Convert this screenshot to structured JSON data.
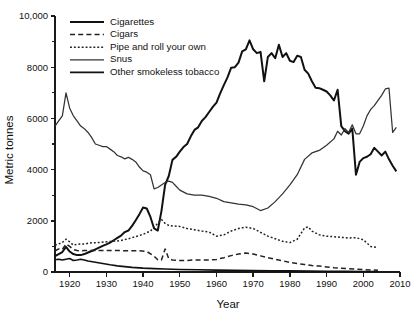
{
  "chart_data": {
    "type": "line",
    "title": "",
    "xlabel": "Year",
    "ylabel": "Metric tonnes",
    "xlim": [
      1916,
      2010
    ],
    "ylim": [
      0,
      10000
    ],
    "grid": false,
    "legend_position": "top-left",
    "xticks": [
      1920,
      1930,
      1940,
      1950,
      1960,
      1970,
      1980,
      1990,
      2000,
      2010
    ],
    "xtick_labels": [
      "1920",
      "1930",
      "1940",
      "1950",
      "1960",
      "1970",
      "1980",
      "1990",
      "2000",
      "2010"
    ],
    "yticks": [
      0,
      2000,
      4000,
      6000,
      8000,
      10000
    ],
    "ytick_labels": [
      "0",
      "2000",
      "4000",
      "6000",
      "8000",
      "10,000"
    ],
    "yticks_minor": [
      1000,
      3000,
      5000,
      7000,
      9000
    ],
    "series": [
      {
        "name": "Cigarettes",
        "style": "solid",
        "width": 2.0,
        "color": "#111111",
        "x": [
          1916,
          1917,
          1918,
          1919,
          1920,
          1921,
          1922,
          1923,
          1924,
          1925,
          1926,
          1927,
          1928,
          1929,
          1930,
          1931,
          1932,
          1933,
          1934,
          1935,
          1936,
          1937,
          1938,
          1939,
          1940,
          1941,
          1942,
          1943,
          1944,
          1945,
          1946,
          1947,
          1948,
          1949,
          1950,
          1951,
          1952,
          1953,
          1954,
          1955,
          1956,
          1957,
          1958,
          1959,
          1960,
          1961,
          1962,
          1963,
          1964,
          1965,
          1966,
          1967,
          1968,
          1969,
          1970,
          1971,
          1972,
          1973,
          1974,
          1975,
          1976,
          1977,
          1978,
          1979,
          1980,
          1981,
          1982,
          1983,
          1984,
          1985,
          1986,
          1987,
          1988,
          1989,
          1990,
          1991,
          1992,
          1993,
          1994,
          1995,
          1996,
          1997,
          1998,
          1999,
          2000,
          2001,
          2002,
          2003,
          2004,
          2005,
          2006,
          2007,
          2008,
          2009
        ],
        "y": [
          620,
          700,
          780,
          980,
          800,
          700,
          660,
          660,
          700,
          760,
          820,
          880,
          950,
          1020,
          1080,
          1150,
          1240,
          1330,
          1420,
          1560,
          1620,
          1800,
          2020,
          2260,
          2520,
          2480,
          2150,
          1700,
          1620,
          2380,
          3400,
          3750,
          4380,
          4500,
          4700,
          4880,
          5000,
          5300,
          5550,
          5650,
          5900,
          6050,
          6250,
          6450,
          6620,
          6980,
          7300,
          7600,
          7980,
          8000,
          8180,
          8620,
          8700,
          9050,
          8700,
          8550,
          8600,
          7450,
          8400,
          8550,
          8350,
          8880,
          8400,
          8550,
          8250,
          8200,
          8450,
          8400,
          7900,
          7750,
          7450,
          7200,
          7180,
          7120,
          7050,
          6900,
          6700,
          7120,
          5700,
          5500,
          5400,
          5600,
          3800,
          4300,
          4450,
          4500,
          4600,
          4850,
          4700,
          4550,
          4700,
          4400,
          4150,
          3930
        ]
      },
      {
        "name": "Cigars",
        "style": "dashed",
        "width": 1.5,
        "color": "#222222",
        "x": [
          1916,
          1917,
          1918,
          1919,
          1920,
          1921,
          1922,
          1923,
          1924,
          1925,
          1927,
          1929,
          1931,
          1933,
          1935,
          1937,
          1939,
          1941,
          1943,
          1944,
          1945,
          1946,
          1947,
          1948,
          1950,
          1952,
          1954,
          1956,
          1958,
          1960,
          1962,
          1964,
          1966,
          1968,
          1970,
          1972,
          1974,
          1976,
          1978,
          1980,
          1982,
          1984,
          1986,
          1988,
          1990,
          1992,
          1994,
          1996,
          1998,
          2000,
          2002,
          2004
        ],
        "y": [
          820,
          900,
          880,
          1100,
          1000,
          880,
          840,
          830,
          840,
          840,
          840,
          840,
          840,
          840,
          830,
          830,
          830,
          800,
          620,
          480,
          470,
          900,
          520,
          470,
          450,
          450,
          470,
          470,
          470,
          490,
          560,
          640,
          700,
          740,
          700,
          630,
          560,
          500,
          440,
          370,
          330,
          290,
          250,
          230,
          200,
          170,
          150,
          130,
          110,
          95,
          80,
          70
        ]
      },
      {
        "name": "Pipe and roll your own",
        "style": "dotted",
        "width": 1.5,
        "color": "#222222",
        "x": [
          1916,
          1917,
          1918,
          1919,
          1920,
          1921,
          1922,
          1923,
          1924,
          1925,
          1926,
          1928,
          1930,
          1932,
          1934,
          1936,
          1938,
          1940,
          1942,
          1944,
          1945,
          1946,
          1947,
          1948,
          1950,
          1952,
          1954,
          1956,
          1958,
          1960,
          1962,
          1964,
          1966,
          1968,
          1970,
          1972,
          1974,
          1976,
          1978,
          1980,
          1982,
          1984,
          1985,
          1986,
          1988,
          1990,
          1992,
          1994,
          1996,
          1998,
          2000,
          2002,
          2004
        ],
        "y": [
          1050,
          1100,
          1150,
          1280,
          1180,
          1050,
          1080,
          1100,
          1090,
          1120,
          1140,
          1150,
          1180,
          1200,
          1230,
          1300,
          1380,
          1470,
          1600,
          1900,
          2050,
          1900,
          1820,
          1800,
          1780,
          1700,
          1650,
          1600,
          1560,
          1400,
          1450,
          1600,
          1700,
          1750,
          1700,
          1550,
          1400,
          1300,
          1200,
          1150,
          1280,
          1720,
          1760,
          1600,
          1450,
          1400,
          1380,
          1350,
          1330,
          1340,
          1260,
          1000,
          950
        ]
      },
      {
        "name": "Snus",
        "style": "solid",
        "width": 1.25,
        "color": "#333333",
        "x": [
          1916,
          1917,
          1918,
          1919,
          1920,
          1921,
          1922,
          1923,
          1924,
          1925,
          1926,
          1927,
          1928,
          1929,
          1930,
          1931,
          1932,
          1933,
          1934,
          1935,
          1936,
          1937,
          1938,
          1939,
          1940,
          1941,
          1942,
          1943,
          1944,
          1945,
          1946,
          1947,
          1948,
          1949,
          1950,
          1952,
          1954,
          1956,
          1958,
          1960,
          1962,
          1964,
          1966,
          1968,
          1970,
          1972,
          1974,
          1976,
          1978,
          1980,
          1982,
          1984,
          1986,
          1988,
          1990,
          1992,
          1993,
          1994,
          1995,
          1996,
          1997,
          1998,
          1999,
          2000,
          2001,
          2002,
          2003,
          2004,
          2005,
          2006,
          2007,
          2008,
          2009
        ],
        "y": [
          5700,
          5900,
          6100,
          7000,
          6400,
          6100,
          5900,
          5700,
          5600,
          5450,
          5250,
          5000,
          4950,
          4900,
          4900,
          4800,
          4700,
          4550,
          4500,
          4420,
          4480,
          4400,
          4300,
          4100,
          3950,
          3900,
          3800,
          3250,
          3300,
          3400,
          3500,
          3550,
          3500,
          3350,
          3200,
          3050,
          3000,
          3000,
          2950,
          2880,
          2750,
          2700,
          2650,
          2620,
          2550,
          2400,
          2500,
          2750,
          3050,
          3400,
          3800,
          4400,
          4650,
          4750,
          4950,
          5200,
          5500,
          5350,
          5600,
          5450,
          5750,
          5400,
          5400,
          5700,
          6100,
          6350,
          6500,
          6700,
          6900,
          7150,
          7180,
          5450,
          5650
        ]
      },
      {
        "name": "Other smokeless tobacco",
        "style": "solid",
        "width": 1.6,
        "color": "#111111",
        "x": [
          1916,
          1917,
          1918,
          1919,
          1920,
          1921,
          1922,
          1923,
          1924,
          1925,
          1927,
          1929,
          1931,
          1933,
          1935,
          1937,
          1940,
          1943,
          1946,
          1950,
          1955,
          1960,
          1965,
          1970,
          1975,
          1980,
          1985,
          1990,
          1995,
          2000,
          2004
        ],
        "y": [
          480,
          500,
          470,
          500,
          530,
          450,
          470,
          500,
          470,
          430,
          380,
          330,
          280,
          240,
          210,
          180,
          150,
          130,
          115,
          100,
          85,
          75,
          65,
          58,
          50,
          44,
          38,
          32,
          26,
          22,
          18
        ]
      }
    ]
  },
  "legend": {
    "items": [
      {
        "label": "Cigarettes",
        "style": "solid"
      },
      {
        "label": "Cigars",
        "style": "dashed"
      },
      {
        "label": "Pipe and roll your own",
        "style": "dotted"
      },
      {
        "label": "Snus",
        "style": "solid"
      },
      {
        "label": "Other smokeless tobacco",
        "style": "solid"
      }
    ]
  }
}
